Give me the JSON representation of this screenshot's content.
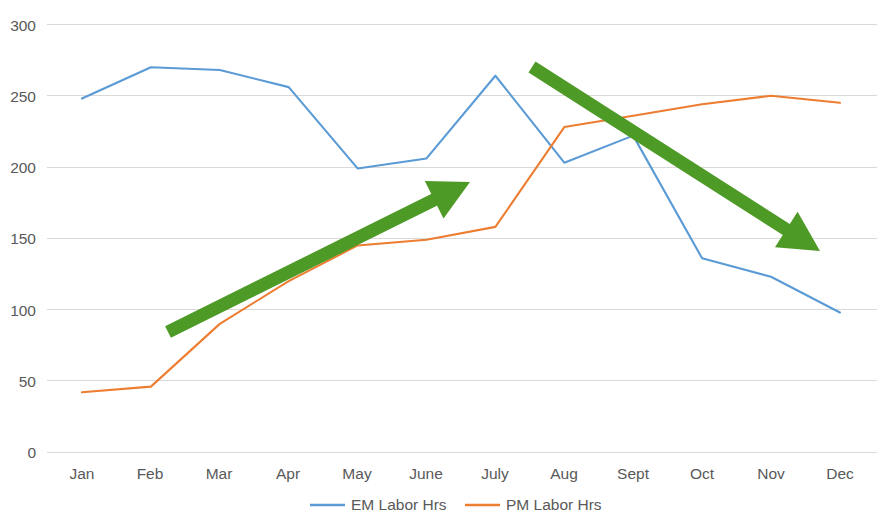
{
  "chart_data": {
    "type": "line",
    "title": "",
    "subtitle": "",
    "xlabel": "",
    "ylabel": "",
    "categories": [
      "Jan",
      "Feb",
      "Mar",
      "Apr",
      "May",
      "June",
      "July",
      "Aug",
      "Sept",
      "Oct",
      "Nov",
      "Dec"
    ],
    "series": [
      {
        "name": "EM Labor Hrs",
        "color": "#5B9BD5",
        "values": [
          248,
          270,
          268,
          256,
          199,
          206,
          264,
          203,
          222,
          136,
          123,
          98
        ]
      },
      {
        "name": "PM Labor Hrs",
        "color": "#ED7D31",
        "values": [
          42,
          46,
          90,
          120,
          145,
          149,
          158,
          228,
          236,
          244,
          250,
          245
        ]
      }
    ],
    "ylim": [
      0,
      300
    ],
    "yticks": [
      0,
      50,
      100,
      150,
      200,
      250,
      300
    ],
    "ytick_labels": [
      "0",
      "50",
      "100",
      "150",
      "200",
      "250",
      "300"
    ],
    "grid": true,
    "grid_axis": "y",
    "grid_color": "#D9D9D9",
    "legend_position": "bottom",
    "plot_background": "#FFFFFF"
  },
  "annotations": {
    "color": "#4E9A26",
    "items": [
      {
        "name": "pm-rising-trend-arrow",
        "direction": "up-right",
        "x1": 168,
        "y1": 332,
        "x2": 470,
        "y2": 182
      },
      {
        "name": "em-declining-trend-arrow",
        "direction": "down-right",
        "x1": 532,
        "y1": 67,
        "x2": 820,
        "y2": 251
      }
    ]
  },
  "legend": {
    "entries": [
      {
        "label": "EM Labor Hrs",
        "color": "#5B9BD5"
      },
      {
        "label": "PM Labor Hrs",
        "color": "#ED7D31"
      }
    ]
  },
  "axes": {
    "y_tick_labels": [
      "300",
      "250",
      "200",
      "150",
      "100",
      "50",
      "0"
    ],
    "x_tick_labels": [
      "Jan",
      "Feb",
      "Mar",
      "Apr",
      "May",
      "June",
      "July",
      "Aug",
      "Sept",
      "Oct",
      "Nov",
      "Dec"
    ]
  }
}
